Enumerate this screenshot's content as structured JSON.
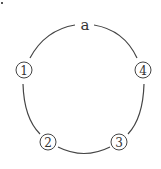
{
  "diagram": {
    "type": "cycle",
    "top_label": "a",
    "nodes": [
      {
        "id": "1",
        "label": "1",
        "position": "left"
      },
      {
        "id": "2",
        "label": "2",
        "position": "bottom-left"
      },
      {
        "id": "3",
        "label": "3",
        "position": "bottom-right"
      },
      {
        "id": "4",
        "label": "4",
        "position": "right"
      }
    ],
    "edges": [
      [
        "a",
        "1"
      ],
      [
        "1",
        "2"
      ],
      [
        "2",
        "3"
      ],
      [
        "3",
        "4"
      ],
      [
        "4",
        "a"
      ]
    ],
    "colors": {
      "stroke": "#444444",
      "text": "#333333",
      "background": "#ffffff"
    }
  }
}
